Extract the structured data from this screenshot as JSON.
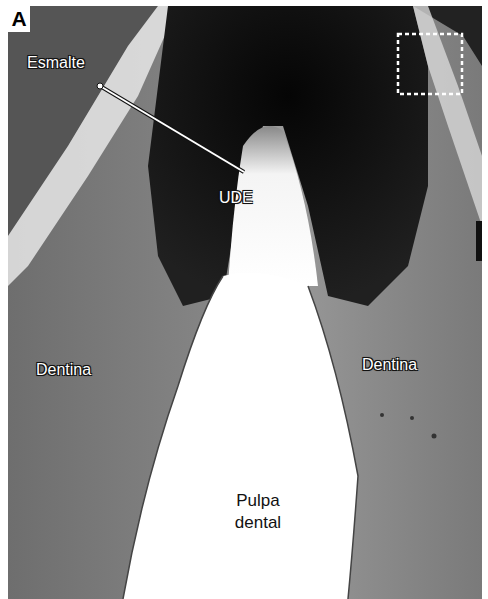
{
  "figure": {
    "panel_label": "A",
    "labels": {
      "enamel": "Esmalte",
      "dej": "UDE",
      "dentin_left": "Dentina",
      "dentin_right": "Dentina",
      "pulp_line1": "Pulpa",
      "pulp_line2": "dental"
    },
    "colors": {
      "background_dark": "#0a0a0a",
      "dentin_gray": "#8a8a8a",
      "pulp_white": "#ffffff",
      "annotation_line": "#ffffff"
    }
  }
}
